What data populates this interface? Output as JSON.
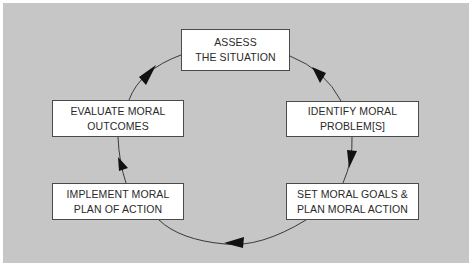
{
  "diagram": {
    "type": "cycle",
    "direction": "clockwise",
    "colors": {
      "background": "#c6c6c6",
      "box_fill": "#ffffff",
      "box_border": "#4a4a4a",
      "arrow": "#1a1a1a",
      "text": "#2a2a2a"
    },
    "nodes": [
      {
        "id": "assess",
        "lines": [
          "ASSESS",
          "THE SITUATION"
        ]
      },
      {
        "id": "identify",
        "lines": [
          "IDENTIFY MORAL",
          "PROBLEM[S]"
        ]
      },
      {
        "id": "setgoals",
        "lines": [
          "SET MORAL GOALS &",
          "PLAN MORAL ACTION"
        ]
      },
      {
        "id": "implement",
        "lines": [
          "IMPLEMENT MORAL",
          "PLAN OF ACTION"
        ]
      },
      {
        "id": "evaluate",
        "lines": [
          "EVALUATE MORAL",
          "OUTCOMES"
        ]
      }
    ],
    "edges": [
      {
        "from": "assess",
        "to": "identify"
      },
      {
        "from": "identify",
        "to": "setgoals"
      },
      {
        "from": "setgoals",
        "to": "implement"
      },
      {
        "from": "implement",
        "to": "evaluate"
      },
      {
        "from": "evaluate",
        "to": "assess"
      }
    ]
  }
}
